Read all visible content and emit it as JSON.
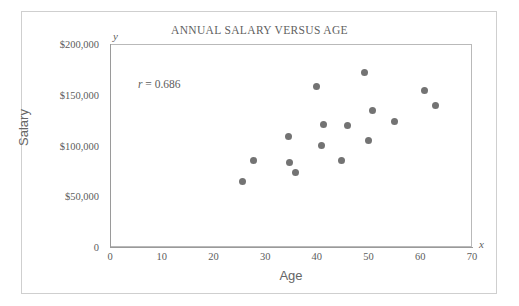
{
  "chart_data": {
    "type": "scatter",
    "title": "ANNUAL SALARY VERSUS AGE",
    "xlabel": "Age",
    "ylabel": "Salary",
    "x_axis_symbol": "x",
    "y_axis_symbol": "y",
    "xlim": [
      0,
      70
    ],
    "ylim": [
      0,
      200000
    ],
    "grid": false,
    "legend": null,
    "marker_color": "#737373",
    "frame_color": "#b9b9b9",
    "annotations": [
      {
        "symbol": "r",
        "text": " = 0.686",
        "value": 0.686
      }
    ],
    "xticks": [
      {
        "value": 0,
        "label": "0"
      },
      {
        "value": 10,
        "label": "10"
      },
      {
        "value": 20,
        "label": "20"
      },
      {
        "value": 30,
        "label": "30"
      },
      {
        "value": 40,
        "label": "40"
      },
      {
        "value": 50,
        "label": "50"
      },
      {
        "value": 60,
        "label": "60"
      },
      {
        "value": 70,
        "label": "70"
      }
    ],
    "yticks": [
      {
        "value": 0,
        "label": "0"
      },
      {
        "value": 50000,
        "label": "$50,000"
      },
      {
        "value": 100000,
        "label": "$100,000"
      },
      {
        "value": 150000,
        "label": "$150,000"
      },
      {
        "value": 200000,
        "label": "$200,000"
      }
    ],
    "points": [
      {
        "x": 25.6,
        "y": 65000
      },
      {
        "x": 27.8,
        "y": 85000
      },
      {
        "x": 34.6,
        "y": 109000
      },
      {
        "x": 34.8,
        "y": 83000
      },
      {
        "x": 35.8,
        "y": 73000
      },
      {
        "x": 39.9,
        "y": 158000
      },
      {
        "x": 40.9,
        "y": 100000
      },
      {
        "x": 41.2,
        "y": 121000
      },
      {
        "x": 44.8,
        "y": 85000
      },
      {
        "x": 45.9,
        "y": 120000
      },
      {
        "x": 49.3,
        "y": 172000
      },
      {
        "x": 49.9,
        "y": 105000
      },
      {
        "x": 50.7,
        "y": 134000
      },
      {
        "x": 55.1,
        "y": 124000
      },
      {
        "x": 60.9,
        "y": 154000
      },
      {
        "x": 63.0,
        "y": 139000
      }
    ]
  }
}
